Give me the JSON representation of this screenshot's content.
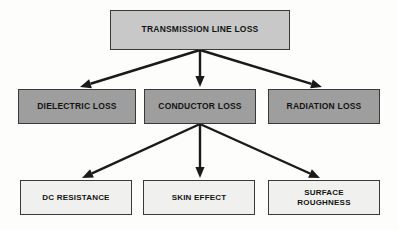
{
  "diagram": {
    "background_color": "#fdfdfc",
    "edge_color": "#1a1a1a",
    "border_color": "#3a3a3a",
    "levels": {
      "root_fill": "#c8c8c8",
      "mid_fill": "#9e9e9e",
      "leaf_fill": "#f0f0ee"
    },
    "nodes": [
      {
        "id": "transmission-line-loss",
        "label": "TRANSMISSION LINE LOSS",
        "level": "root",
        "x": 110,
        "y": 10,
        "w": 180,
        "h": 40
      },
      {
        "id": "dielectric-loss",
        "label": "DIELECTRIC LOSS",
        "level": "mid",
        "x": 18,
        "y": 89,
        "w": 118,
        "h": 35
      },
      {
        "id": "conductor-loss",
        "label": "CONDUCTOR LOSS",
        "level": "mid",
        "x": 144,
        "y": 89,
        "w": 112,
        "h": 35
      },
      {
        "id": "radiation-loss",
        "label": "RADIATION LOSS",
        "level": "mid",
        "x": 268,
        "y": 89,
        "w": 112,
        "h": 35
      },
      {
        "id": "dc-resistance",
        "label": "DC RESISTANCE",
        "level": "leaf",
        "x": 20,
        "y": 180,
        "w": 112,
        "h": 35
      },
      {
        "id": "skin-effect",
        "label": "SKIN EFFECT",
        "level": "leaf",
        "x": 143,
        "y": 180,
        "w": 112,
        "h": 35
      },
      {
        "id": "surface-roughness",
        "label": "SURFACE\nROUGHNESS",
        "level": "leaf",
        "x": 268,
        "y": 180,
        "w": 112,
        "h": 35
      }
    ],
    "edges": [
      {
        "id": "edge-root-to-dielectric",
        "from": "transmission-line-loss",
        "to": "dielectric-loss",
        "x1": 200,
        "y1": 50,
        "x2": 80,
        "y2": 87
      },
      {
        "id": "edge-root-to-conductor",
        "from": "transmission-line-loss",
        "to": "conductor-loss",
        "x1": 200,
        "y1": 50,
        "x2": 200,
        "y2": 87
      },
      {
        "id": "edge-root-to-radiation",
        "from": "transmission-line-loss",
        "to": "radiation-loss",
        "x1": 200,
        "y1": 50,
        "x2": 322,
        "y2": 87
      },
      {
        "id": "edge-conductor-to-dc-resistance",
        "from": "conductor-loss",
        "to": "dc-resistance",
        "x1": 200,
        "y1": 124,
        "x2": 82,
        "y2": 178
      },
      {
        "id": "edge-conductor-to-skin-effect",
        "from": "conductor-loss",
        "to": "skin-effect",
        "x1": 200,
        "y1": 124,
        "x2": 200,
        "y2": 178
      },
      {
        "id": "edge-conductor-to-surface-roughness",
        "from": "conductor-loss",
        "to": "surface-roughness",
        "x1": 200,
        "y1": 124,
        "x2": 320,
        "y2": 178
      }
    ]
  }
}
